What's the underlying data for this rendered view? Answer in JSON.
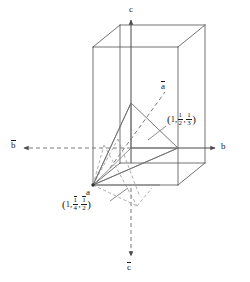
{
  "figure": {
    "background_color": "#ffffff",
    "line_color": "#555555",
    "text_color": "#1a1a1a",
    "width": 250,
    "height": 282
  },
  "axes": {
    "c_positive": {
      "label": "c",
      "x": 129,
      "y": 9,
      "direction": "up",
      "style": "solid-arrow"
    },
    "c_negative": {
      "label": "c",
      "overbar": true,
      "x": 128,
      "y": 262,
      "direction": "down",
      "style": "dashed-arrow"
    },
    "b_positive": {
      "label": "b",
      "x": 221,
      "y": 142,
      "direction": "right",
      "style": "solid-arrow"
    },
    "b_negative": {
      "label": "b",
      "overbar": true,
      "x": 10,
      "y": 141,
      "direction": "left",
      "style": "dashed-arrow"
    },
    "a_negative": {
      "label": "a",
      "overbar": true,
      "x": 160,
      "y": 82,
      "direction": "up-right",
      "style": "dashed"
    },
    "a_origin": {
      "label": "a",
      "x": 85,
      "y": 188,
      "style": "vertex"
    }
  },
  "coordinate_labels": [
    {
      "id": "upper-plane-intercepts",
      "text": "(1,1/2,1/3)",
      "parts": {
        "first": "1",
        "second_num": "1",
        "second_den": "2",
        "third_num": "1",
        "third_den": "3"
      },
      "overbars": {
        "second_num": false,
        "third_num": false
      },
      "x": 167,
      "y": 116
    },
    {
      "id": "lower-plane-intercepts",
      "text": "(1,-1/4,-1/2)",
      "parts": {
        "first": "1",
        "second_num": "1",
        "second_den": "4",
        "third_num": "1",
        "third_den": "2"
      },
      "overbars": {
        "second_num": true,
        "third_num": true
      },
      "x": 62,
      "y": 200
    }
  ],
  "geometry": {
    "unit_cell": {
      "front_face": {
        "left": 93,
        "right": 178,
        "top": 47,
        "bottom": 185
      },
      "depth_offset": {
        "dx": 27,
        "dy": -22
      }
    },
    "origin_point": {
      "x": 93,
      "y": 185,
      "name": "a"
    },
    "upper_triangle": {
      "vertices": [
        [
          93,
          185
        ],
        [
          131,
          103
        ],
        [
          178,
          148
        ]
      ],
      "style": "solid"
    },
    "lower_triangle": {
      "vertices": [
        [
          93,
          185
        ],
        [
          131,
          200
        ],
        [
          160,
          178
        ]
      ],
      "style": "dashed"
    }
  }
}
